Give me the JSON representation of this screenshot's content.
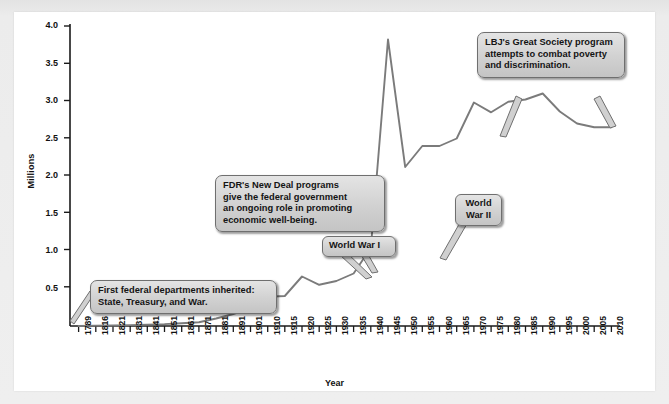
{
  "chart_data": {
    "type": "line",
    "title": "",
    "xlabel": "Year",
    "ylabel": "Millions",
    "ylim": [
      0,
      4.0
    ],
    "yticks": [
      "4.0",
      "3.5",
      "3.0",
      "2.5",
      "2.0",
      "1.5",
      "1.0",
      "0.5"
    ],
    "ytick_values": [
      4.0,
      3.5,
      3.0,
      2.5,
      2.0,
      1.5,
      1.0,
      0.5
    ],
    "grid": false,
    "legend": "none",
    "categories": [
      "1789",
      "1816",
      "1821",
      "1831",
      "1841",
      "1851",
      "1861",
      "1871",
      "1881",
      "1891",
      "1901",
      "1910",
      "1915",
      "1920",
      "1925",
      "1930",
      "1935",
      "1940",
      "1945",
      "1950",
      "1955",
      "1960",
      "1965",
      "1970",
      "1975",
      "1980",
      "1985",
      "1990",
      "1995",
      "2000",
      "2005",
      "2010"
    ],
    "series": [
      {
        "name": "Federal civilian employees",
        "values": [
          0.0,
          0.005,
          0.007,
          0.012,
          0.018,
          0.026,
          0.037,
          0.051,
          0.1,
          0.16,
          0.24,
          0.39,
          0.4,
          0.66,
          0.55,
          0.6,
          0.7,
          1.04,
          3.82,
          2.12,
          2.4,
          2.4,
          2.5,
          2.98,
          2.85,
          2.99,
          3.02,
          3.1,
          2.86,
          2.7,
          2.65,
          2.65
        ]
      }
    ],
    "annotations": [
      {
        "id": "first-departments",
        "text": "First federal departments inherited: State, Treasury, and War.",
        "anchor_year": "1789"
      },
      {
        "id": "fdr-new-deal",
        "text": "FDR's New Deal programs give the federal government an ongoing role in promoting economic well-being.",
        "anchor_year": "1935"
      },
      {
        "id": "world-war-1",
        "text": "World War I",
        "anchor_year": "1918"
      },
      {
        "id": "world-war-2",
        "text": "World War II",
        "anchor_year": "1945"
      },
      {
        "id": "lbj-great-society",
        "text": "LBJ's Great Society program attempts to combat poverty and discrimination.",
        "anchor_year": "1965"
      }
    ],
    "colors": {
      "line": "#7b7b7b",
      "axis": "#1a1a1a",
      "plot_background": "#ffffff",
      "page_background": "#ececec",
      "callout_fill": "#d4d4d4",
      "callout_border": "#6f6f6f"
    }
  },
  "axis": {
    "y_title": "Millions",
    "x_title": "Year",
    "y_ticks": [
      "4.0",
      "3.5",
      "3.0",
      "2.5",
      "2.0",
      "1.5",
      "1.0",
      "0.5"
    ],
    "x_ticks": [
      "1789",
      "1816",
      "1821",
      "1831",
      "1841",
      "1851",
      "1861",
      "1871",
      "1881",
      "1891",
      "1901",
      "1910",
      "1915",
      "1920",
      "1925",
      "1930",
      "1935",
      "1940",
      "1945",
      "1950",
      "1955",
      "1960",
      "1965",
      "1970",
      "1975",
      "1980",
      "1985",
      "1990",
      "1995",
      "2000",
      "2005",
      "2010"
    ]
  },
  "callouts": {
    "first_departments": {
      "line1": "First federal departments inherited:",
      "line2": "State, Treasury, and War."
    },
    "fdr_new_deal": {
      "line1": "FDR's New Deal programs",
      "line2": "give the federal government",
      "line3": "an ongoing role in promoting",
      "line4": "economic well-being."
    },
    "world_war_1": {
      "line1": "World War I"
    },
    "world_war_2": {
      "line1": "World",
      "line2": "War II"
    },
    "lbj_great_society": {
      "line1": "LBJ's Great Society program",
      "line2": "attempts to combat poverty",
      "line3": "and discrimination."
    }
  }
}
